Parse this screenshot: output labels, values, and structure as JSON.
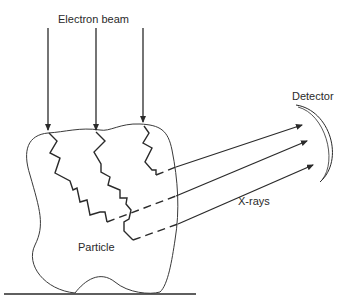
{
  "diagram": {
    "labels": {
      "beam": "Electron beam",
      "detector": "Detector",
      "xrays": "X-rays",
      "particle": "Particle"
    },
    "colors": {
      "line": "#2a2a2a",
      "background": "#ffffff"
    },
    "counts": {
      "incident_beams": 3,
      "xray_paths": 3
    }
  }
}
